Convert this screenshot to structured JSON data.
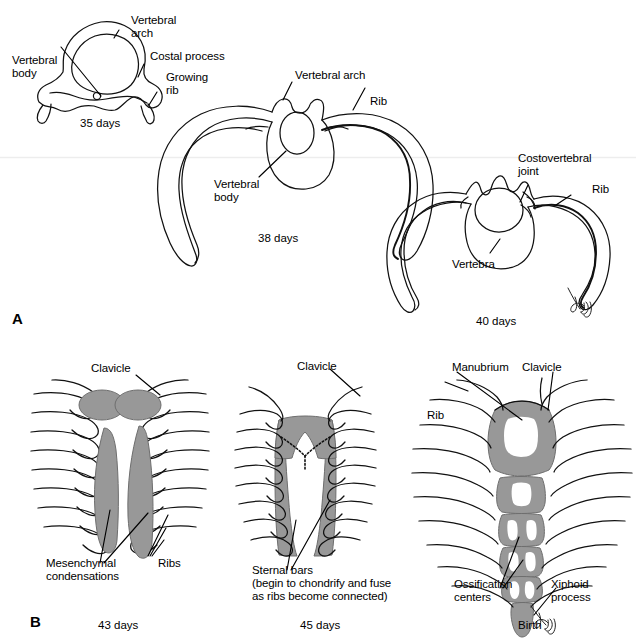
{
  "figure": {
    "background_color": "#ffffff",
    "ink_color": "#000000",
    "shade_color": "#989898",
    "shade_edge_color": "#6b6b6b"
  },
  "panels": [
    {
      "letter": "A",
      "subject": "Transverse sections showing rib and vertebra development",
      "figures": [
        {
          "caption": "35 days",
          "labels": [
            {
              "text": "Vertebral\narch",
              "name": "label-vertebral-arch-35"
            },
            {
              "text": "Costal process",
              "name": "label-costal-process-35"
            },
            {
              "text": "Growing\nrib",
              "name": "label-growing-rib-35"
            },
            {
              "text": "Vertebral\nbody",
              "name": "label-vertebral-body-35"
            }
          ]
        },
        {
          "caption": "38 days",
          "labels": [
            {
              "text": "Vertebral arch",
              "name": "label-vertebral-arch-38"
            },
            {
              "text": "Rib",
              "name": "label-rib-38"
            },
            {
              "text": "Vertebral\nbody",
              "name": "label-vertebral-body-38"
            }
          ]
        },
        {
          "caption": "40 days",
          "labels": [
            {
              "text": "Costovertebral\njoint",
              "name": "label-costovertebral-joint-40"
            },
            {
              "text": "Rib",
              "name": "label-rib-40"
            },
            {
              "text": "Vertebra",
              "name": "label-vertebra-40"
            }
          ]
        }
      ]
    },
    {
      "letter": "B",
      "subject": "Ventral views showing sternum formation",
      "figures": [
        {
          "caption": "43 days",
          "labels": [
            {
              "text": "Clavicle",
              "name": "label-clavicle-43"
            },
            {
              "text": "Mesenchymal\ncondensations",
              "name": "label-mesenchymal-condensations-43"
            },
            {
              "text": "Ribs",
              "name": "label-ribs-43"
            }
          ]
        },
        {
          "caption": "45 days",
          "labels": [
            {
              "text": "Clavicle",
              "name": "label-clavicle-45"
            },
            {
              "text": "Sternal bars\n(begin to chondrify and fuse\nas ribs become connected)",
              "name": "label-sternal-bars-45"
            }
          ]
        },
        {
          "caption": "Birth",
          "labels": [
            {
              "text": "Manubrium",
              "name": "label-manubrium-birth"
            },
            {
              "text": "Clavicle",
              "name": "label-clavicle-birth"
            },
            {
              "text": "Rib",
              "name": "label-rib-birth"
            },
            {
              "text": "Ossification\ncenters",
              "name": "label-ossification-centers-birth"
            },
            {
              "text": "Xiphoid\nprocess",
              "name": "label-xiphoid-process-birth"
            }
          ]
        }
      ]
    }
  ],
  "labels_flat": {
    "a_vertebral_arch_35_l1": "Vertebral",
    "a_vertebral_arch_35_l2": "arch",
    "a_costal_process_35": "Costal process",
    "a_growing_rib_l1": "Growing",
    "a_growing_rib_l2": "rib",
    "a_vertebral_body_35_l1": "Vertebral",
    "a_vertebral_body_35_l2": "body",
    "a_caption_35": "35 days",
    "a_vertebral_arch_38": "Vertebral arch",
    "a_rib_38": "Rib",
    "a_vertebral_body_38_l1": "Vertebral",
    "a_vertebral_body_38_l2": "body",
    "a_caption_38": "38 days",
    "a_costovertebral_l1": "Costovertebral",
    "a_costovertebral_l2": "joint",
    "a_rib_40": "Rib",
    "a_vertebra_40": "Vertebra",
    "a_caption_40": "40 days",
    "panel_a_letter": "A",
    "b_clavicle_43": "Clavicle",
    "b_mesenchymal_l1": "Mesenchymal",
    "b_mesenchymal_l2": "condensations",
    "b_ribs_43": "Ribs",
    "b_caption_43": "43 days",
    "panel_b_letter": "B",
    "b_clavicle_45": "Clavicle",
    "b_sternal_bars_l1": "Sternal bars",
    "b_sternal_bars_l2": "(begin to chondrify and fuse",
    "b_sternal_bars_l3": "as ribs become connected)",
    "b_caption_45": "45 days",
    "b_manubrium": "Manubrium",
    "b_clavicle_birth": "Clavicle",
    "b_rib_birth": "Rib",
    "b_ossification_l1": "Ossification",
    "b_ossification_l2": "centers",
    "b_xiphoid_l1": "Xiphoid",
    "b_xiphoid_l2": "process",
    "b_caption_birth": "Birth",
    "signature": "mcg"
  }
}
